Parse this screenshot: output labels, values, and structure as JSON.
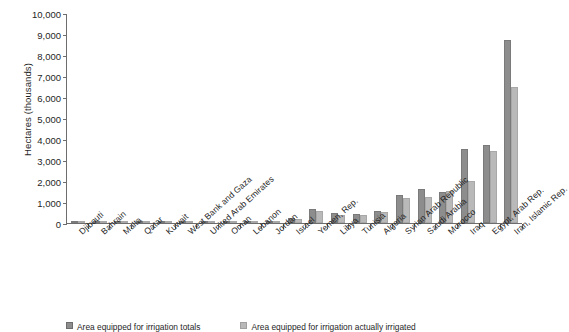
{
  "chart_data": {
    "type": "bar",
    "title": "",
    "xlabel": "",
    "ylabel": "Hectares (thousands)",
    "ylim": [
      0,
      10000
    ],
    "ytick_labels": [
      "10,000",
      "9,000",
      "8,000",
      "7,000",
      "6,000",
      "5,000",
      "4,000",
      "3,000",
      "2,000",
      "1,000",
      "0"
    ],
    "ytick_values": [
      10000,
      9000,
      8000,
      7000,
      6000,
      5000,
      4000,
      3000,
      2000,
      1000,
      0
    ],
    "grid": false,
    "legend_position": "bottom",
    "categories": [
      "Djibouti",
      "Bahrain",
      "Malta",
      "Qatar",
      "Kuwait",
      "West Bank and Gaza",
      "United Arab Emirates",
      "Oman",
      "Lebanon",
      "Jordan",
      "Israel",
      "Yemen, Rep.",
      "Libya",
      "Tunisia",
      "Algeria",
      "Syrian Arab Republic",
      "Saudi Arabia",
      "Morocco",
      "Iraq",
      "Egypt, Arab Rep.",
      "Iran, Islamic Rep."
    ],
    "series": [
      {
        "name": "Area equipped for irrigation totals",
        "color": "#8d8d8d",
        "values": [
          1,
          4,
          3,
          13,
          11,
          20,
          76,
          62,
          104,
          77,
          225,
          680,
          470,
          445,
          570,
          1350,
          1620,
          1480,
          3525,
          3700,
          8700
        ]
      },
      {
        "name": "Area equipped for irrigation actually irrigated",
        "color": "#b9b9b9",
        "values": [
          1,
          4,
          3,
          13,
          11,
          18,
          68,
          58,
          90,
          64,
          185,
          550,
          395,
          400,
          530,
          1200,
          1250,
          1530,
          1980,
          3440,
          6500
        ]
      }
    ]
  },
  "legend": {
    "items": [
      {
        "label": "Area equipped for irrigation totals",
        "swatch": "equipped"
      },
      {
        "label": "Area equipped for irrigation actually irrigated",
        "swatch": "irrigated"
      }
    ]
  }
}
